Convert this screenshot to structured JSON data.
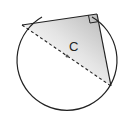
{
  "diagram": {
    "title": "",
    "type": "geometry",
    "center_label": "C",
    "colors": {
      "stroke": "#222222",
      "background": "#ffffff",
      "shade_dark": "#b8b8b8",
      "shade_light": "#ffffff"
    },
    "circle": {
      "cx": 62,
      "cy": 63,
      "r": 50,
      "gap_start_deg": 247,
      "gap_end_deg": 300
    },
    "triangle": {
      "vertices": [
        {
          "name": "A",
          "x": 22,
          "y": 25
        },
        {
          "name": "B",
          "x": 97,
          "y": 14
        },
        {
          "name": "D",
          "x": 111,
          "y": 86
        }
      ],
      "right_angle_at": "B",
      "shaded": true
    },
    "diameter": {
      "from": "A",
      "to": "D",
      "style": "dashed"
    },
    "center_point": {
      "x": 67,
      "y": 56
    }
  }
}
